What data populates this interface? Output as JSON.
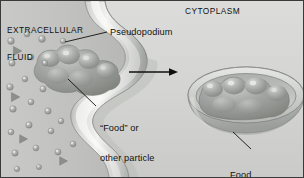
{
  "figure": {
    "regions": {
      "extracellular": "EXTRACELLULAR\nFLUID",
      "extracellular_line1": "EXTRACELLULAR",
      "extracellular_line2": "FLUID",
      "cytoplasm": "CYTOPLASM"
    },
    "callouts": {
      "pseudopodium": "Pseudopodium",
      "food_particle_line1": "“Food” or",
      "food_particle_line2": "other particle",
      "food_vacuole_line1": "Food",
      "food_vacuole_line2": "vacuole"
    },
    "icons": {
      "process_arrow": "right-arrow-icon",
      "leader_pseudopodium": "leader-line-icon",
      "leader_food": "leader-line-icon",
      "leader_vacuole": "leader-line-icon",
      "solute_sphere": "sphere-particle-icon",
      "solute_triangle": "triangle-particle-icon"
    },
    "colors": {
      "background": "#cfd0cd",
      "extracellular_fluid": "#c3c4c1",
      "cytoplasm": "#d4d5d2",
      "membrane_light": "#e9eae7",
      "membrane_mid": "#b9bab7",
      "membrane_dark": "#8f9290",
      "particle": "#9a9d9b",
      "particle_highlight": "#c8cac8",
      "vacuole_rim": "#bcbebb",
      "vacuole_interior": "#a9acaa",
      "leader_line": "#1a1a1a",
      "text": "#111111",
      "frame": "#3a3a3a"
    },
    "particles": {
      "spheres": [
        {
          "x": 10,
          "y": 40,
          "r": 3.4
        },
        {
          "x": 26,
          "y": 33,
          "r": 3.0
        },
        {
          "x": 41,
          "y": 38,
          "r": 3.4
        },
        {
          "x": 11,
          "y": 62,
          "r": 3.2
        },
        {
          "x": 30,
          "y": 56,
          "r": 3.0
        },
        {
          "x": 44,
          "y": 62,
          "r": 2.8
        },
        {
          "x": 9,
          "y": 86,
          "r": 3.3
        },
        {
          "x": 24,
          "y": 78,
          "r": 2.9
        },
        {
          "x": 42,
          "y": 88,
          "r": 3.1
        },
        {
          "x": 12,
          "y": 108,
          "r": 3.3
        },
        {
          "x": 30,
          "y": 101,
          "r": 3.0
        },
        {
          "x": 47,
          "y": 110,
          "r": 3.2
        },
        {
          "x": 10,
          "y": 131,
          "r": 3.0
        },
        {
          "x": 28,
          "y": 124,
          "r": 3.2
        },
        {
          "x": 50,
          "y": 130,
          "r": 3.0
        },
        {
          "x": 14,
          "y": 152,
          "r": 3.2
        },
        {
          "x": 35,
          "y": 147,
          "r": 2.9
        },
        {
          "x": 57,
          "y": 151,
          "r": 3.1
        },
        {
          "x": 62,
          "y": 40,
          "r": 2.8
        },
        {
          "x": 60,
          "y": 120,
          "r": 2.9
        },
        {
          "x": 72,
          "y": 143,
          "r": 3.0
        },
        {
          "x": 16,
          "y": 168,
          "r": 2.8
        },
        {
          "x": 38,
          "y": 166,
          "r": 2.6
        }
      ],
      "triangles": [
        {
          "x": 16,
          "y": 50,
          "s": 6.5
        },
        {
          "x": 14,
          "y": 96,
          "s": 6.5
        },
        {
          "x": 22,
          "y": 138,
          "s": 6.0
        },
        {
          "x": 62,
          "y": 160,
          "s": 6.0
        }
      ]
    }
  }
}
